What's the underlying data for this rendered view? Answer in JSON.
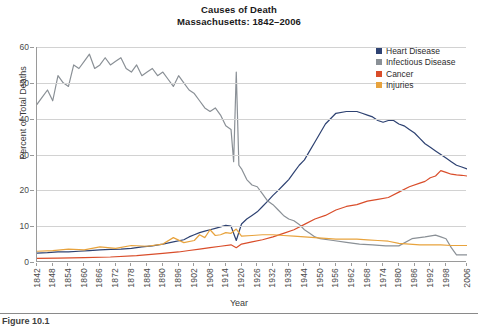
{
  "figure": {
    "title_line1": "Causes of Death",
    "title_line2": "Massachusetts: 1842–2006",
    "caption": "Figure 10.1"
  },
  "chart_data": {
    "type": "line",
    "title": "Causes of Death Massachusetts: 1842–2006",
    "subtitle": "Massachusetts: 1842–2006",
    "xlabel": "Year",
    "ylabel": "Percent of Total Deaths",
    "xlim": [
      1842,
      2006
    ],
    "ylim": [
      0,
      60
    ],
    "yticks": [
      0,
      10,
      20,
      30,
      40,
      50,
      60
    ],
    "xticks": [
      1842,
      1848,
      1854,
      1860,
      1866,
      1872,
      1878,
      1884,
      1890,
      1896,
      1902,
      1908,
      1914,
      1920,
      1926,
      1932,
      1938,
      1944,
      1950,
      1956,
      1962,
      1968,
      1974,
      1980,
      1986,
      1992,
      1998,
      2006
    ],
    "grid": "horizontal",
    "legend_position": "top-right",
    "colors": {
      "heart_disease": "#2e4272",
      "infectious_disease": "#8a9096",
      "cancer": "#d94d2a",
      "injuries": "#e8a33d",
      "gridline": "#d2d2d2",
      "axis": "#9a9a9a"
    },
    "series": [
      {
        "name": "Heart Disease",
        "color": "#2e4272",
        "x": [
          1842,
          1846,
          1850,
          1854,
          1858,
          1862,
          1866,
          1870,
          1874,
          1878,
          1882,
          1886,
          1890,
          1894,
          1898,
          1900,
          1902,
          1904,
          1906,
          1908,
          1910,
          1912,
          1914,
          1916,
          1918,
          1920,
          1922,
          1924,
          1926,
          1928,
          1930,
          1932,
          1934,
          1936,
          1938,
          1940,
          1942,
          1944,
          1946,
          1948,
          1950,
          1952,
          1956,
          1960,
          1964,
          1966,
          1968,
          1970,
          1972,
          1974,
          1976,
          1978,
          1980,
          1982,
          1984,
          1986,
          1988,
          1990,
          1992,
          1994,
          1996,
          1998,
          2000,
          2002,
          2004,
          2006
        ],
        "values": [
          2.5,
          2.6,
          2.8,
          2.8,
          3.0,
          3.2,
          3.4,
          3.5,
          3.6,
          3.8,
          4.2,
          4.5,
          5.0,
          5.6,
          6.2,
          7.0,
          7.6,
          8.2,
          8.6,
          9.0,
          9.4,
          9.8,
          10.2,
          10.0,
          6.0,
          10.6,
          12.0,
          13.0,
          14.0,
          15.5,
          17.0,
          18.6,
          20.0,
          21.5,
          23.0,
          25.0,
          27.0,
          28.5,
          31.0,
          33.5,
          36.0,
          38.5,
          41.5,
          42.0,
          42.0,
          41.5,
          41.0,
          40.5,
          39.5,
          39.0,
          39.5,
          39.5,
          38.5,
          38.0,
          37.0,
          36.0,
          34.5,
          33.0,
          32.0,
          31.0,
          30.0,
          29.0,
          28.0,
          27.0,
          26.5,
          26.0
        ]
      },
      {
        "name": "Infectious Disease",
        "color": "#8a9096",
        "x": [
          1842,
          1844,
          1846,
          1848,
          1850,
          1852,
          1854,
          1856,
          1858,
          1860,
          1862,
          1864,
          1866,
          1868,
          1870,
          1872,
          1874,
          1876,
          1878,
          1880,
          1882,
          1884,
          1886,
          1888,
          1890,
          1892,
          1894,
          1896,
          1898,
          1900,
          1902,
          1904,
          1906,
          1908,
          1910,
          1912,
          1914,
          1916,
          1917,
          1918,
          1919,
          1920,
          1922,
          1924,
          1926,
          1928,
          1930,
          1932,
          1934,
          1936,
          1938,
          1940,
          1942,
          1944,
          1946,
          1948,
          1950,
          1955,
          1960,
          1965,
          1970,
          1975,
          1980,
          1985,
          1990,
          1994,
          1996,
          1998,
          2000,
          2002,
          2004,
          2006
        ],
        "values": [
          44.0,
          46.0,
          48.0,
          45.0,
          52.0,
          50.0,
          49.0,
          55.0,
          54.0,
          56.0,
          58.0,
          54.0,
          55.0,
          57.0,
          55.0,
          56.0,
          57.0,
          54.0,
          53.0,
          55.0,
          52.0,
          53.0,
          54.0,
          52.0,
          53.0,
          51.0,
          49.0,
          52.0,
          50.0,
          48.0,
          47.0,
          45.0,
          43.0,
          42.0,
          43.0,
          41.0,
          38.0,
          37.0,
          28.0,
          53.0,
          27.0,
          26.0,
          23.0,
          21.5,
          21.0,
          19.0,
          17.0,
          16.0,
          14.5,
          13.0,
          12.0,
          11.5,
          10.5,
          9.0,
          8.0,
          7.0,
          6.5,
          6.0,
          5.5,
          5.0,
          4.8,
          4.5,
          4.5,
          6.5,
          7.0,
          7.5,
          7.0,
          6.5,
          4.0,
          2.0,
          2.0,
          2.0
        ]
      },
      {
        "name": "Cancer",
        "color": "#d94d2a",
        "x": [
          1842,
          1850,
          1860,
          1870,
          1880,
          1890,
          1896,
          1900,
          1904,
          1908,
          1912,
          1916,
          1918,
          1920,
          1924,
          1928,
          1932,
          1936,
          1940,
          1944,
          1948,
          1952,
          1956,
          1960,
          1964,
          1968,
          1972,
          1976,
          1980,
          1984,
          1988,
          1990,
          1992,
          1994,
          1996,
          1998,
          2000,
          2002,
          2004,
          2006
        ],
        "values": [
          1.0,
          1.1,
          1.2,
          1.4,
          1.8,
          2.4,
          2.8,
          3.2,
          3.6,
          4.0,
          4.4,
          4.8,
          4.0,
          5.0,
          5.6,
          6.2,
          7.0,
          8.0,
          9.0,
          10.5,
          12.0,
          13.0,
          14.5,
          15.5,
          16.0,
          17.0,
          17.5,
          18.0,
          19.5,
          21.0,
          22.0,
          22.5,
          23.5,
          24.0,
          25.5,
          25.0,
          24.5,
          24.3,
          24.2,
          24.0
        ]
      },
      {
        "name": "Injuries",
        "color": "#e8a33d",
        "x": [
          1842,
          1848,
          1854,
          1860,
          1866,
          1872,
          1878,
          1884,
          1890,
          1894,
          1898,
          1902,
          1904,
          1906,
          1908,
          1910,
          1912,
          1914,
          1916,
          1918,
          1920,
          1924,
          1928,
          1932,
          1936,
          1940,
          1944,
          1948,
          1952,
          1956,
          1960,
          1964,
          1968,
          1972,
          1976,
          1980,
          1984,
          1988,
          1992,
          1996,
          2000,
          2004,
          2006
        ],
        "values": [
          3.0,
          3.2,
          3.6,
          3.4,
          4.2,
          3.8,
          4.6,
          4.4,
          5.0,
          6.8,
          5.4,
          6.0,
          7.6,
          6.8,
          9.0,
          7.4,
          7.6,
          8.2,
          8.0,
          9.2,
          7.2,
          7.4,
          7.6,
          7.6,
          7.4,
          7.2,
          7.0,
          6.8,
          6.6,
          6.4,
          6.4,
          6.4,
          6.2,
          6.0,
          5.8,
          5.2,
          5.0,
          4.8,
          4.8,
          4.8,
          4.6,
          4.6,
          4.6
        ]
      }
    ]
  },
  "axes": {
    "y_title": "Percent of Total Deaths",
    "x_title": "Year",
    "y_ticks": [
      "0",
      "10",
      "20",
      "30",
      "40",
      "50",
      "60"
    ],
    "x_ticks": [
      "1842",
      "1848",
      "1854",
      "1860",
      "1866",
      "1872",
      "1878",
      "1884",
      "1890",
      "1896",
      "1902",
      "1908",
      "1914",
      "1920",
      "1926",
      "1932",
      "1938",
      "1944",
      "1950",
      "1956",
      "1962",
      "1968",
      "1974",
      "1980",
      "1986",
      "1992",
      "1998",
      "2006"
    ]
  },
  "legend": {
    "items": [
      {
        "label": "Heart Disease",
        "color": "#2e4272"
      },
      {
        "label": "Infectious Disease",
        "color": "#8a9096"
      },
      {
        "label": "Cancer",
        "color": "#d94d2a"
      },
      {
        "label": "Injuries",
        "color": "#e8a33d"
      }
    ]
  }
}
